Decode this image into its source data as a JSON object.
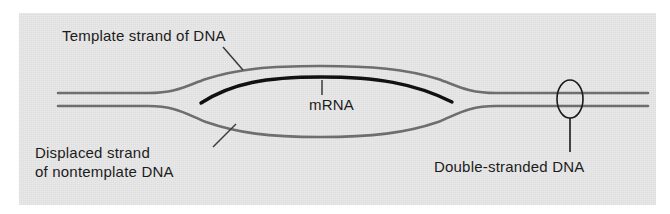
{
  "figure": {
    "kind": "biology-diagram",
    "panel_background_color": "#e9e9e9",
    "page_background_color": "#ffffff"
  },
  "labels": {
    "template_strand": "Template strand of DNA",
    "displaced_strand_line1": "Displaced strand",
    "displaced_strand_line2": "of nontemplate DNA",
    "mrna": "mRNA",
    "double_stranded": "Double-stranded DNA"
  },
  "elements": {
    "dna_strand_color": "#6e6e6e",
    "mrna_color": "#111111",
    "leader_line_color": "#3a3a3a",
    "ellipse_color": "#1a1a1a",
    "top_strand_name": "template-strand-of-dna",
    "bottom_strand_name": "displaced-nontemplate-strand",
    "transcript_name": "mrna-transcript",
    "marker_name": "double-stranded-dna-marker"
  }
}
